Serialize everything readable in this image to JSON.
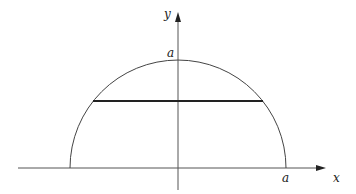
{
  "diagram": {
    "title": "",
    "axes": {
      "x_label": "x",
      "y_label": "y"
    },
    "labels": {
      "y_intercept": "a",
      "x_intercept": "a"
    },
    "shapes": [
      {
        "type": "semicircle",
        "center": [
          0,
          0
        ],
        "radius": "a",
        "description": "upper half of circle radius a"
      },
      {
        "type": "chord",
        "description": "horizontal chord across semicircle",
        "style": "thick"
      }
    ],
    "colors": {
      "stroke": "#333333",
      "chord": "#222222"
    }
  }
}
